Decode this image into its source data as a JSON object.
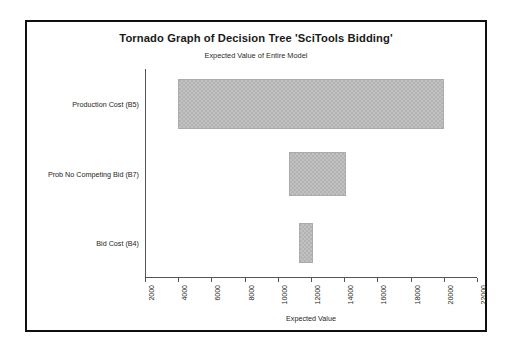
{
  "chart_data": {
    "type": "bar",
    "orientation": "horizontal",
    "variant": "tornado",
    "title": "Tornado Graph of Decision Tree 'SciTools Bidding'",
    "subtitle": "Expected Value of Entire Model",
    "xlabel": "Expected Value",
    "ylabel": "",
    "xlim": [
      2000,
      22000
    ],
    "xticks": [
      2000,
      4000,
      6000,
      8000,
      10000,
      12000,
      14000,
      16000,
      18000,
      20000,
      22000
    ],
    "grid": false,
    "legend": false,
    "bar_color": "#b3b3b3",
    "categories": [
      "Production Cost (B5)",
      "Prob No Competing Bid (B7)",
      "Bid Cost (B4)"
    ],
    "bars": [
      {
        "category": "Production Cost (B5)",
        "low": 4000,
        "high": 20000,
        "span": 16000
      },
      {
        "category": "Prob No Competing Bid (B7)",
        "low": 10700,
        "high": 14100,
        "span": 3400
      },
      {
        "category": "Bid Cost (B4)",
        "low": 11300,
        "high": 12100,
        "span": 800
      }
    ]
  },
  "chart": {
    "title": "Tornado Graph of Decision Tree 'SciTools Bidding'",
    "subtitle": "Expected Value of Entire Model",
    "x_axis_title": "Expected Value"
  }
}
